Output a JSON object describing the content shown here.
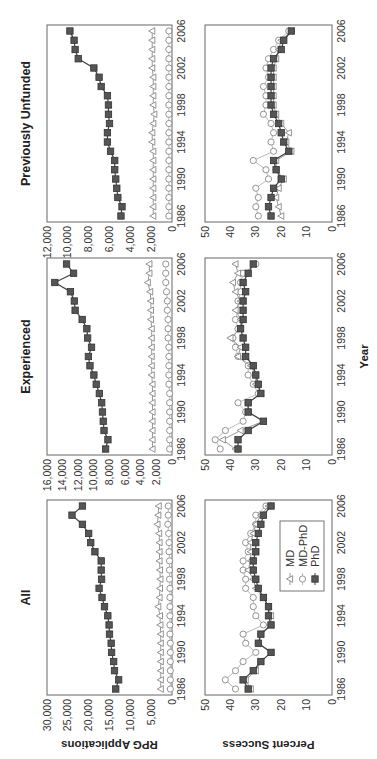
{
  "chart_data": {
    "type": "line",
    "layout": "2 rows x 3 columns, figure rotated 90 degrees counterclockwise",
    "x": [
      1986,
      1987,
      1988,
      1989,
      1990,
      1991,
      1992,
      1993,
      1994,
      1995,
      1996,
      1997,
      1998,
      1999,
      2000,
      2001,
      2002,
      2003,
      2004,
      2005,
      2006
    ],
    "xticks": [
      "1986",
      "1990",
      "1994",
      "1998",
      "2002",
      "2006"
    ],
    "xlabel": "Year",
    "legend": {
      "position": "inside bottom-left panel, lower right",
      "entries": [
        {
          "name": "MD",
          "marker": "triangle"
        },
        {
          "name": "MD-PhD",
          "marker": "circle"
        },
        {
          "name": "PhD",
          "marker": "square"
        }
      ]
    },
    "panels": [
      {
        "id": "all-applications",
        "row": 0,
        "col": 0,
        "title": "All",
        "ylabel": "RPG Applications",
        "ylim": [
          0,
          30000
        ],
        "yticks": [
          "0",
          "5,000",
          "10,000",
          "15,000",
          "20,000",
          "25,000",
          "30,000"
        ],
        "series": [
          {
            "name": "PhD",
            "values": [
              13500,
              12800,
              13800,
              14000,
              14500,
              14600,
              15000,
              15100,
              15400,
              16200,
              16800,
              17500,
              16900,
              17000,
              17000,
              18500,
              19500,
              20000,
              21500,
              24000,
              21500,
              23000,
              23500
            ]
          },
          {
            "name": "MD",
            "values": [
              2700,
              2700,
              2700,
              2700,
              2700,
              2700,
              2700,
              2800,
              2900,
              3300,
              3000,
              2900,
              2800,
              2900,
              3000,
              3000,
              3000,
              3100,
              3500,
              3300,
              3200
            ]
          },
          {
            "name": "MD-PhD",
            "values": [
              400,
              400,
              400,
              400,
              400,
              400,
              500,
              500,
              500,
              500,
              500,
              500,
              600,
              600,
              600,
              700,
              700,
              800,
              1000,
              900,
              900
            ]
          }
        ]
      },
      {
        "id": "experienced-applications",
        "row": 0,
        "col": 1,
        "title": "Experienced",
        "ylabel": "",
        "ylim": [
          0,
          16000
        ],
        "yticks": [
          "0",
          "2,000",
          "4,000",
          "6,000",
          "8,000",
          "10,000",
          "12,000",
          "14,000",
          "16,000"
        ],
        "series": [
          {
            "name": "PhD",
            "values": [
              8500,
              8200,
              8700,
              8800,
              8900,
              9000,
              9300,
              9700,
              10000,
              10500,
              10700,
              10300,
              10800,
              10900,
              11500,
              12400,
              12500,
              13000,
              15000,
              12600,
              13500,
              14000
            ]
          },
          {
            "name": "MD",
            "values": [
              2500,
              2500,
              2500,
              2500,
              2500,
              2500,
              2500,
              2500,
              2600,
              2600,
              2600,
              2600,
              2600,
              2600,
              2700,
              2700,
              2700,
              2800,
              3100,
              2900,
              2900
            ]
          },
          {
            "name": "MD-PhD",
            "values": [
              300,
              300,
              300,
              300,
              300,
              300,
              300,
              400,
              400,
              400,
              400,
              400,
              500,
              500,
              500,
              600,
              600,
              700,
              800,
              800,
              800
            ]
          }
        ]
      },
      {
        "id": "unfunded-applications",
        "row": 0,
        "col": 2,
        "title": "Previously Unfunded",
        "ylabel": "",
        "ylim": [
          0,
          12000
        ],
        "yticks": [
          "0",
          "2,000",
          "4,000",
          "6,000",
          "8,000",
          "10,000",
          "12,000"
        ],
        "series": [
          {
            "name": "PhD",
            "values": [
              4900,
              4800,
              5200,
              5300,
              5400,
              5500,
              5500,
              5900,
              6200,
              6200,
              6000,
              6100,
              6100,
              6200,
              6800,
              7000,
              7500,
              9000,
              9300,
              9400,
              9800
            ]
          },
          {
            "name": "MD",
            "values": [
              1800,
              1800,
              1800,
              1800,
              1800,
              1800,
              1800,
              1800,
              1900,
              1900,
              1800,
              1700,
              1800,
              1800,
              1800,
              1800,
              1900,
              1900,
              1900,
              1900,
              1900
            ]
          },
          {
            "name": "MD-PhD",
            "values": [
              300,
              300,
              300,
              300,
              300,
              300,
              300,
              300,
              300,
              300,
              300,
              300,
              300,
              300,
              300,
              300,
              300,
              300,
              300,
              300,
              300
            ]
          }
        ]
      },
      {
        "id": "all-success",
        "row": 1,
        "col": 0,
        "title": "",
        "ylabel": "Percent Success",
        "ylim": [
          0,
          50
        ],
        "yticks": [
          "0",
          "10",
          "20",
          "30",
          "40",
          "50"
        ],
        "series": [
          {
            "name": "PhD",
            "values": [
              33,
              35,
              31,
              28,
              24,
              29,
              28,
              24,
              25,
              25,
              27,
              29,
              30,
              31,
              31,
              30,
              30,
              29,
              28,
              27,
              24
            ]
          },
          {
            "name": "MD",
            "values": [
              32,
              34,
              30,
              28,
              24,
              29,
              28,
              24,
              24,
              25,
              27,
              30,
              31,
              33,
              32,
              32,
              32,
              31,
              30,
              28,
              25
            ]
          },
          {
            "name": "MD-PhD",
            "values": [
              38,
              42,
              38,
              35,
              30,
              34,
              35,
              27,
              30,
              31,
              31,
              34,
              34,
              35,
              35,
              33,
              34,
              32,
              30,
              30,
              26
            ]
          }
        ]
      },
      {
        "id": "experienced-success",
        "row": 1,
        "col": 1,
        "title": "",
        "ylabel": "",
        "ylim": [
          0,
          50
        ],
        "yticks": [
          "0",
          "10",
          "20",
          "30",
          "40",
          "50"
        ],
        "series": [
          {
            "name": "PhD",
            "values": [
              37,
              37,
              33,
              27,
              33,
              33,
              28,
              29,
              30,
              31,
              34,
              34,
              35,
              36,
              35,
              35,
              35,
              34,
              35,
              33,
              31
            ]
          },
          {
            "name": "MD",
            "values": [
              38,
              43,
              36,
              27,
              33,
              33,
              28,
              30,
              30,
              32,
              37,
              36,
              40,
              36,
              36,
              38,
              36,
              38,
              39,
              37,
              38
            ]
          },
          {
            "name": "MD-PhD",
            "values": [
              44,
              46,
              42,
              35,
              34,
              37,
              29,
              31,
              33,
              33,
              37,
              38,
              39,
              37,
              38,
              37,
              37,
              36,
              36,
              35,
              30
            ]
          }
        ]
      },
      {
        "id": "unfunded-success",
        "row": 1,
        "col": 2,
        "title": "",
        "ylabel": "",
        "ylim": [
          0,
          50
        ],
        "yticks": [
          "0",
          "10",
          "20",
          "30",
          "40",
          "50"
        ],
        "series": [
          {
            "name": "PhD",
            "values": [
              24,
              25,
              24,
              23,
              20,
              22,
              23,
              17,
              19,
              20,
              21,
              23,
              24,
              24,
              24,
              24,
              24,
              23,
              20,
              19,
              16
            ]
          },
          {
            "name": "MD",
            "values": [
              20,
              21,
              22,
              21,
              19,
              22,
              22,
              16,
              18,
              17,
              20,
              22,
              23,
              23,
              23,
              23,
              23,
              22,
              21,
              20,
              16
            ]
          },
          {
            "name": "MD-PhD",
            "values": [
              29,
              30,
              29,
              30,
              25,
              26,
              31,
              23,
              24,
              23,
              24,
              27,
              26,
              26,
              27,
              25,
              26,
              25,
              23,
              21,
              17
            ]
          }
        ]
      }
    ]
  }
}
